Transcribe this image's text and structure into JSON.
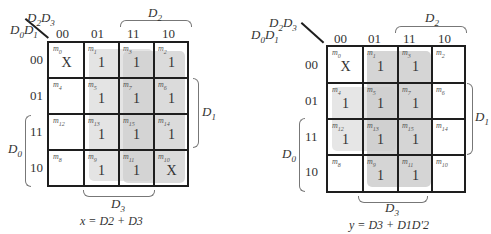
{
  "maps": [
    {
      "id": "x",
      "corner": {
        "row_vars": "D0D1",
        "col_vars": "D2D3"
      },
      "col_headers": [
        "00",
        "01",
        "11",
        "10"
      ],
      "row_headers": [
        "00",
        "01",
        "11",
        "10"
      ],
      "cells": [
        [
          {
            "m": "0",
            "v": "X"
          },
          {
            "m": "1",
            "v": "1"
          },
          {
            "m": "3",
            "v": "1"
          },
          {
            "m": "2",
            "v": "1"
          }
        ],
        [
          {
            "m": "4",
            "v": ""
          },
          {
            "m": "5",
            "v": "1"
          },
          {
            "m": "7",
            "v": "1"
          },
          {
            "m": "6",
            "v": "1"
          }
        ],
        [
          {
            "m": "12",
            "v": ""
          },
          {
            "m": "13",
            "v": "1"
          },
          {
            "m": "15",
            "v": "1"
          },
          {
            "m": "14",
            "v": "1"
          }
        ],
        [
          {
            "m": "8",
            "v": ""
          },
          {
            "m": "9",
            "v": "1"
          },
          {
            "m": "11",
            "v": "1"
          },
          {
            "m": "10",
            "v": "X"
          }
        ]
      ],
      "brace_labels": {
        "top": "D2",
        "right": "D1",
        "left": "D0",
        "bottom": "D3"
      },
      "groups": [
        {
          "name": "D3",
          "cols": [
            1,
            2
          ],
          "rows": [
            0,
            3
          ],
          "color": "#e4e4e4"
        },
        {
          "name": "D2",
          "cols": [
            2,
            3
          ],
          "rows": [
            0,
            3
          ],
          "color": "#cfcfcf"
        }
      ],
      "equation": "x = D2 + D3"
    },
    {
      "id": "y",
      "corner": {
        "row_vars": "D0D1",
        "col_vars": "D2D3"
      },
      "col_headers": [
        "00",
        "01",
        "11",
        "10"
      ],
      "row_headers": [
        "00",
        "01",
        "11",
        "10"
      ],
      "cells": [
        [
          {
            "m": "0",
            "v": "X"
          },
          {
            "m": "1",
            "v": "1"
          },
          {
            "m": "3",
            "v": "1"
          },
          {
            "m": "2",
            "v": ""
          }
        ],
        [
          {
            "m": "4",
            "v": "1"
          },
          {
            "m": "5",
            "v": "1"
          },
          {
            "m": "7",
            "v": "1"
          },
          {
            "m": "6",
            "v": ""
          }
        ],
        [
          {
            "m": "12",
            "v": "1"
          },
          {
            "m": "13",
            "v": "1"
          },
          {
            "m": "15",
            "v": "1"
          },
          {
            "m": "14",
            "v": ""
          }
        ],
        [
          {
            "m": "8",
            "v": ""
          },
          {
            "m": "9",
            "v": "1"
          },
          {
            "m": "11",
            "v": "1"
          },
          {
            "m": "10",
            "v": ""
          }
        ]
      ],
      "brace_labels": {
        "top": "D2",
        "right": "D1",
        "left": "D0",
        "bottom": "D3"
      },
      "groups": [
        {
          "name": "D1D2'",
          "cols": [
            0,
            1
          ],
          "rows": [
            1,
            2
          ],
          "color": "#e6e6e6"
        },
        {
          "name": "D3",
          "cols": [
            1,
            2
          ],
          "rows": [
            0,
            3
          ],
          "color": "#cbcbcb"
        }
      ],
      "equation": "y = D3 + D1D'2"
    }
  ]
}
